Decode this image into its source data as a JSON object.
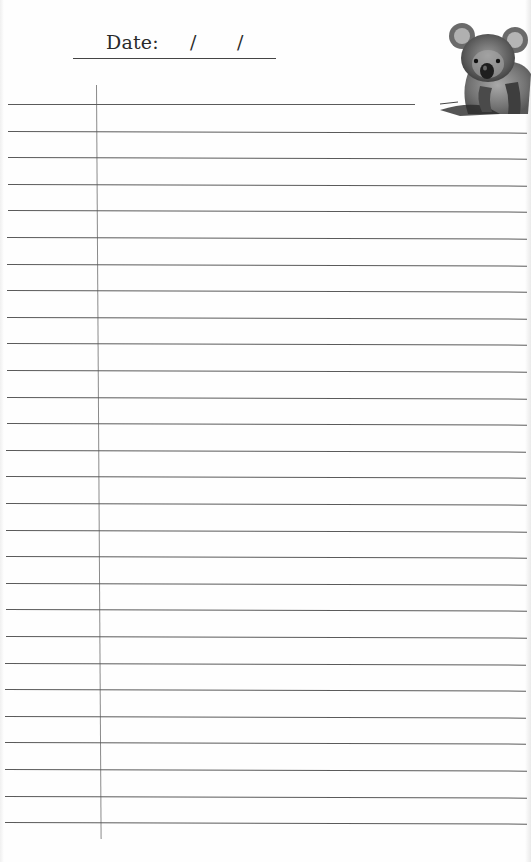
{
  "page": {
    "type": "lined-notebook-page",
    "header": {
      "date_label": "Date:",
      "date_separator_1": "/",
      "date_separator_2": "/",
      "day_value": "",
      "month_value": "",
      "year_value": ""
    },
    "illustration": {
      "icon": "koala-icon",
      "description": "pencil sketch of a koala"
    },
    "lines": {
      "count": 28,
      "first_line_y": 104,
      "spacing_px": 26.6,
      "line_color": "#5a5a5a",
      "margin_line_color": "#8a8a8a"
    },
    "colors": {
      "paper": "#fefefe",
      "ink": "#2a2a2a"
    }
  }
}
